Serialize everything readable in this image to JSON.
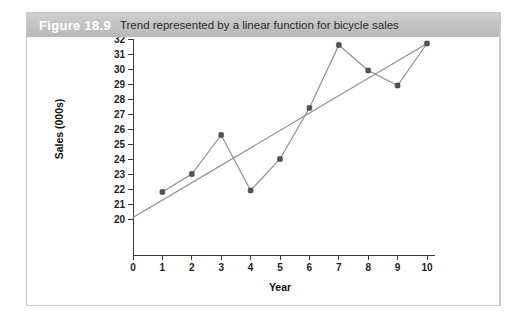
{
  "figure": {
    "number": "Figure 18.9",
    "caption": "Trend represented by a linear function for bicycle sales"
  },
  "colors": {
    "header_bar": "#c4c4c4",
    "header_number_text": "#ffffff",
    "caption_text": "#2b2b2b",
    "series_line": "#8e8e97",
    "trend_line": "#8e8e97",
    "marker_fill": "#53535c",
    "axis": "#3a3a3a",
    "panel_border": "#c9c9c9",
    "background": "#ffffff"
  },
  "chart_data": {
    "type": "line",
    "title": "Trend represented by a linear function for bicycle sales",
    "xlabel": "Year",
    "ylabel": "Sales (000s)",
    "xlim": [
      0,
      10
    ],
    "ylim": [
      20,
      32
    ],
    "grid": false,
    "legend": null,
    "x_ticks": [
      0,
      1,
      2,
      3,
      4,
      5,
      6,
      7,
      8,
      9,
      10
    ],
    "y_ticks": [
      20,
      21,
      22,
      23,
      24,
      25,
      26,
      27,
      28,
      29,
      30,
      31,
      32
    ],
    "x_tick_labels": [
      "0",
      "1",
      "2",
      "3",
      "4",
      "5",
      "6",
      "7",
      "8",
      "9",
      "10"
    ],
    "y_tick_labels": [
      "20",
      "21",
      "22",
      "23",
      "24",
      "25",
      "26",
      "27",
      "28",
      "29",
      "30",
      "31",
      "32"
    ],
    "series": [
      {
        "name": "Bicycle sales",
        "style": "line-with-markers",
        "x": [
          1,
          2,
          3,
          4,
          5,
          6,
          7,
          8,
          9,
          10
        ],
        "values": [
          21.8,
          23.0,
          25.6,
          21.9,
          24.0,
          27.4,
          31.6,
          29.9,
          28.9,
          31.7
        ]
      },
      {
        "name": "Linear trend",
        "style": "line",
        "x": [
          0,
          10
        ],
        "values": [
          20.1,
          31.7
        ]
      }
    ]
  }
}
